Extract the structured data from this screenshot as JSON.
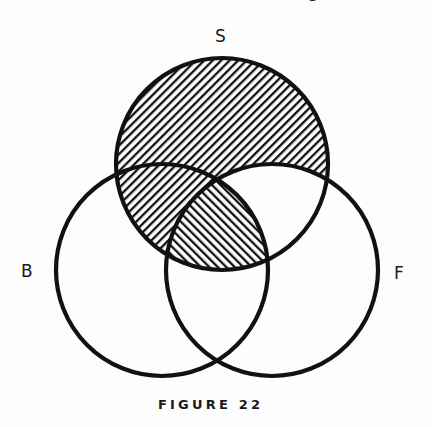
{
  "figure": {
    "caption": "FIGURE 22",
    "type": "venn-diagram",
    "sets": [
      {
        "id": "S",
        "label": "S",
        "center": [
          222,
          164
        ],
        "radius": 106
      },
      {
        "id": "B",
        "label": "B",
        "center": [
          162,
          270
        ],
        "radius": 106
      },
      {
        "id": "F",
        "label": "F",
        "center": [
          272,
          270
        ],
        "radius": 106
      }
    ],
    "regions": {
      "S_only": "hatched-backslash",
      "S_and_B_not_F": "hatched-backslash",
      "S_and_F_not_B": "unshaded",
      "S_and_B_and_F": "hatched-forward-slash",
      "B_only": "unshaded",
      "F_only": "unshaded",
      "B_and_F_not_S": "unshaded"
    }
  },
  "labels": {
    "s": "S",
    "b": "B",
    "f": "F"
  },
  "colors": {
    "ink": "#111111",
    "paper": "#fdfdfd"
  }
}
